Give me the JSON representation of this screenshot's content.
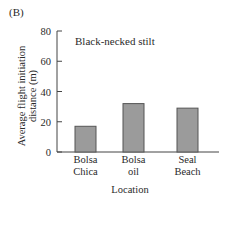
{
  "panel_label": "(B)",
  "chart_data": {
    "type": "bar",
    "title": "Black-necked stilt",
    "categories": [
      "Bolsa Chica",
      "Bolsa oil",
      "Seal Beach"
    ],
    "category_lines": [
      [
        "Bolsa",
        "Chica"
      ],
      [
        "Bolsa",
        "oil"
      ],
      [
        "Seal",
        "Beach"
      ]
    ],
    "values": [
      17,
      32,
      29
    ],
    "xlabel": "Location",
    "ylabel_lines": [
      "Average flight initiation",
      "distance (m)"
    ],
    "ylabel": "Average flight initiation distance (m)",
    "ylim": [
      0,
      80
    ],
    "yticks": [
      0,
      20,
      40,
      60,
      80
    ],
    "grid": false,
    "legend": "none",
    "bar_color": "#9b9b9b",
    "bar_edge_color": "#555555"
  }
}
